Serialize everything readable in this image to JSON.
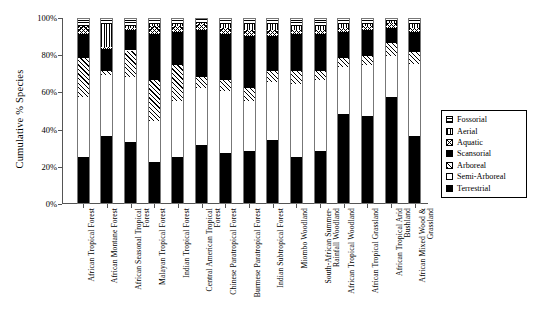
{
  "chart_data": {
    "type": "bar",
    "subtype": "stacked-bar-100-percent",
    "title": "",
    "xlabel": "",
    "ylabel": "Cumulative % Species",
    "ylim": [
      0,
      100
    ],
    "ytick_labels": [
      "0%",
      "20%",
      "40%",
      "60%",
      "80%",
      "100%"
    ],
    "ytick_values": [
      0,
      20,
      40,
      60,
      80,
      100
    ],
    "grid": false,
    "legend_position": "right",
    "stack_order_bottom_to_top": [
      "Terrestrial",
      "Semi-Arboreal",
      "Arboreal",
      "Scansorial",
      "Aquatic",
      "Aerial",
      "Fossorial"
    ],
    "categories": [
      "African Tropical Forest",
      "African Montane Forest",
      "African Seasonal Tropical Forest",
      "Malayan Tropical Forest",
      "Indian Tropical Forest",
      "Central American Tropical Forest",
      "Chinese Paratropical Forest",
      "Burmese Paratropical Forest",
      "Indian Subtropical Forest",
      "Miombo Woodland",
      "South-African Summer-Rainfall Woodland",
      "African Tropical Woodland",
      "African Tropical Grassland",
      "African Tropical Arid Bushland",
      "African Mixed Wood & Grassland"
    ],
    "series": [
      {
        "name": "Terrestrial",
        "pattern": "solid-black",
        "values": [
          25,
          36,
          33,
          22,
          25,
          31,
          27,
          28,
          34,
          25,
          28,
          48,
          47,
          57,
          36
        ]
      },
      {
        "name": "Semi-Arboreal",
        "pattern": "white-empty",
        "values": [
          32,
          33,
          35,
          22,
          30,
          31,
          33,
          27,
          31,
          39,
          38,
          25,
          27,
          22,
          39
        ]
      },
      {
        "name": "Arboreal",
        "pattern": "diagonal-hatch",
        "values": [
          21,
          2,
          14,
          22,
          19,
          6,
          6,
          7,
          6,
          7,
          5,
          5,
          5,
          7,
          6
        ]
      },
      {
        "name": "Scansorial",
        "pattern": "solid-black",
        "values": [
          13,
          12,
          11,
          25,
          18,
          25,
          25,
          28,
          19,
          20,
          20,
          14,
          14,
          8,
          11
        ]
      },
      {
        "name": "Aquatic",
        "pattern": "cross-hatch",
        "values": [
          4,
          1,
          1,
          4,
          3,
          3,
          3,
          3,
          3,
          2,
          2,
          2,
          2,
          3,
          2
        ]
      },
      {
        "name": "Aerial",
        "pattern": "vertical-lines",
        "values": [
          0,
          12,
          1,
          1,
          1,
          1,
          2,
          3,
          3,
          2,
          2,
          2,
          1,
          1,
          2
        ]
      },
      {
        "name": "Fossorial",
        "pattern": "horizontal-lines",
        "values": [
          5,
          4,
          5,
          4,
          4,
          3,
          4,
          4,
          4,
          5,
          5,
          4,
          4,
          2,
          4
        ]
      }
    ]
  },
  "legend": {
    "items": [
      {
        "label": "Fossorial",
        "pattern": "horizontal-lines"
      },
      {
        "label": "Aerial",
        "pattern": "vertical-lines"
      },
      {
        "label": "Aquatic",
        "pattern": "cross-hatch"
      },
      {
        "label": "Scansorial",
        "pattern": "solid-black"
      },
      {
        "label": "Arboreal",
        "pattern": "diagonal-hatch"
      },
      {
        "label": "Semi-Arboreal",
        "pattern": "white-empty"
      },
      {
        "label": "Terrestrial",
        "pattern": "solid-black"
      }
    ]
  },
  "colors": {
    "ink": "#000000",
    "axis": "#555555",
    "background": "#ffffff"
  }
}
